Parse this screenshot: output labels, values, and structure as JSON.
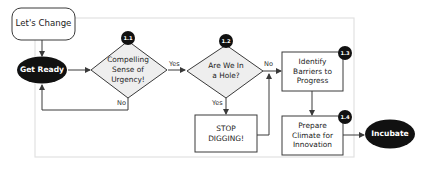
{
  "diagram": {
    "type": "flowchart",
    "colors": {
      "stroke": "#3a3a3a",
      "terminal_fill": "#111111",
      "decision_fill": "#eeeeee",
      "process_fill": "#ffffff",
      "frame_stroke": "#e2e2e2"
    },
    "nodes": {
      "start": {
        "label": "Let's Change",
        "shape": "rounded-rect"
      },
      "get_ready": {
        "label": "Get Ready",
        "shape": "ellipse"
      },
      "d11": {
        "label": "Compelling\nSense of\nUrgency!",
        "badge": "1.1",
        "shape": "diamond"
      },
      "d12": {
        "label": "Are We In\na Hole?",
        "badge": "1.2",
        "shape": "diamond"
      },
      "stop": {
        "label": "STOP\nDIGGING!",
        "shape": "rect"
      },
      "p13": {
        "label": "Identify\nBarriers to\nProgress",
        "badge": "1.3",
        "shape": "rect"
      },
      "p14": {
        "label": "Prepare\nClimate for\nInnovation",
        "badge": "1.4",
        "shape": "rect"
      },
      "end": {
        "label": "Incubate",
        "shape": "ellipse"
      }
    },
    "edges": {
      "start_to_ready": {
        "from": "start",
        "to": "get_ready",
        "label": ""
      },
      "ready_to_d11": {
        "from": "get_ready",
        "to": "d11",
        "label": ""
      },
      "d11_yes": {
        "from": "d11",
        "to": "d12",
        "label": "Yes"
      },
      "d11_no": {
        "from": "d11",
        "to": "get_ready",
        "label": "No"
      },
      "d12_yes": {
        "from": "d12",
        "to": "stop",
        "label": "Yes"
      },
      "d12_no": {
        "from": "d12",
        "to": "p13",
        "label": "No"
      },
      "stop_to_p13": {
        "from": "stop",
        "to": "p13",
        "label": ""
      },
      "p13_to_p14": {
        "from": "p13",
        "to": "p14",
        "label": ""
      },
      "p14_to_end": {
        "from": "p14",
        "to": "end",
        "label": ""
      }
    }
  }
}
